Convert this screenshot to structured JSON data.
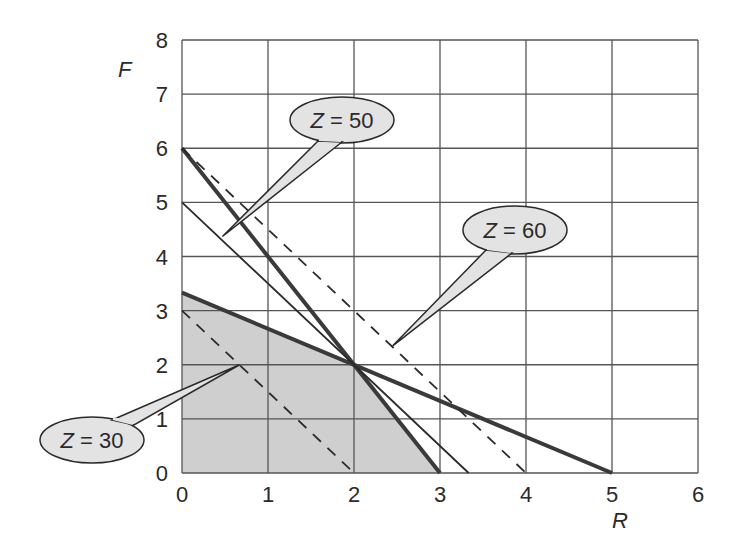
{
  "chart_data": {
    "type": "line",
    "title": "",
    "xlabel": "R",
    "ylabel": "F",
    "xlim": [
      0,
      6
    ],
    "ylim": [
      0,
      8
    ],
    "xticks": [
      "0",
      "1",
      "2",
      "3",
      "4",
      "5",
      "6"
    ],
    "yticks": [
      "0",
      "1",
      "2",
      "3",
      "4",
      "5",
      "6",
      "7",
      "8"
    ],
    "grid": true,
    "feasible_region": {
      "description": "shaded feasible region",
      "vertices": [
        [
          0,
          0
        ],
        [
          0,
          3.333
        ],
        [
          2,
          2
        ],
        [
          3,
          0
        ]
      ],
      "fill": "#cfcfcf"
    },
    "series": [
      {
        "name": "constraint-1",
        "style": "thick-solid",
        "points": [
          [
            0,
            6
          ],
          [
            3,
            0
          ]
        ]
      },
      {
        "name": "constraint-2",
        "style": "thick-solid",
        "points": [
          [
            0,
            3.333
          ],
          [
            5,
            0
          ]
        ]
      },
      {
        "name": "Z = 50",
        "style": "thin-solid",
        "points": [
          [
            0,
            5
          ],
          [
            3.333,
            0
          ]
        ]
      },
      {
        "name": "Z = 30",
        "style": "dashed",
        "points": [
          [
            0,
            3
          ],
          [
            2,
            0
          ]
        ]
      },
      {
        "name": "Z = 60",
        "style": "dashed",
        "points": [
          [
            0,
            6
          ],
          [
            4,
            0
          ]
        ]
      }
    ],
    "annotations": [
      {
        "label_var": "Z",
        "label_rest": " = 50",
        "points_to": [
          0.47,
          4.37
        ]
      },
      {
        "label_var": "Z",
        "label_rest": " = 60",
        "points_to": [
          2.45,
          2.35
        ]
      },
      {
        "label_var": "Z",
        "label_rest": " = 30",
        "points_to": [
          0.67,
          2.0
        ]
      }
    ],
    "colors": {
      "grid": "#555555",
      "thick_line": "#3a3a3a",
      "thin_line": "#2a2a2a",
      "bubble_fill": "#e3e3e3",
      "bubble_stroke": "#2a2a2a"
    }
  }
}
